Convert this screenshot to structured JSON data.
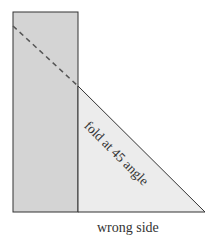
{
  "diagram": {
    "fold_label": "fold at 45  angle",
    "bottom_label": "wrong side",
    "colors": {
      "strip_fill": "#d4d4d4",
      "triangle_fill": "#ececec",
      "stroke": "#333333"
    }
  }
}
